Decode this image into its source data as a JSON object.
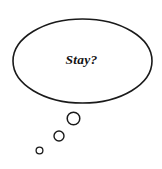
{
  "canvas": {
    "width": 162,
    "height": 169,
    "background_color": "#ffffff"
  },
  "illustration": {
    "kind": "thought-bubble",
    "description": "Hand-drawn style thought balloon with three descending circular tail bubbles",
    "stroke_color": "#1a1a1a",
    "fill_color": "#ffffff",
    "bubble": {
      "shape": "ellipse",
      "center_x": 82.5,
      "center_y": 61,
      "radius_x": 69.5,
      "radius_y": 42,
      "stroke_width": 1.6
    },
    "text": {
      "content": "Stay?",
      "x": 81.5,
      "y": 64,
      "color": "#141414",
      "style": "bold-italic-serif",
      "font_size": 13.5
    },
    "tail_circles": [
      {
        "name": "tail-bubble-large",
        "cx": 73.5,
        "cy": 118.5,
        "r": 6.3,
        "stroke_width": 1.5
      },
      {
        "name": "tail-bubble-medium",
        "cx": 59,
        "cy": 136,
        "r": 5.0,
        "stroke_width": 1.4
      },
      {
        "name": "tail-bubble-small",
        "cx": 39.5,
        "cy": 150.5,
        "r": 3.4,
        "stroke_width": 1.3
      }
    ]
  }
}
